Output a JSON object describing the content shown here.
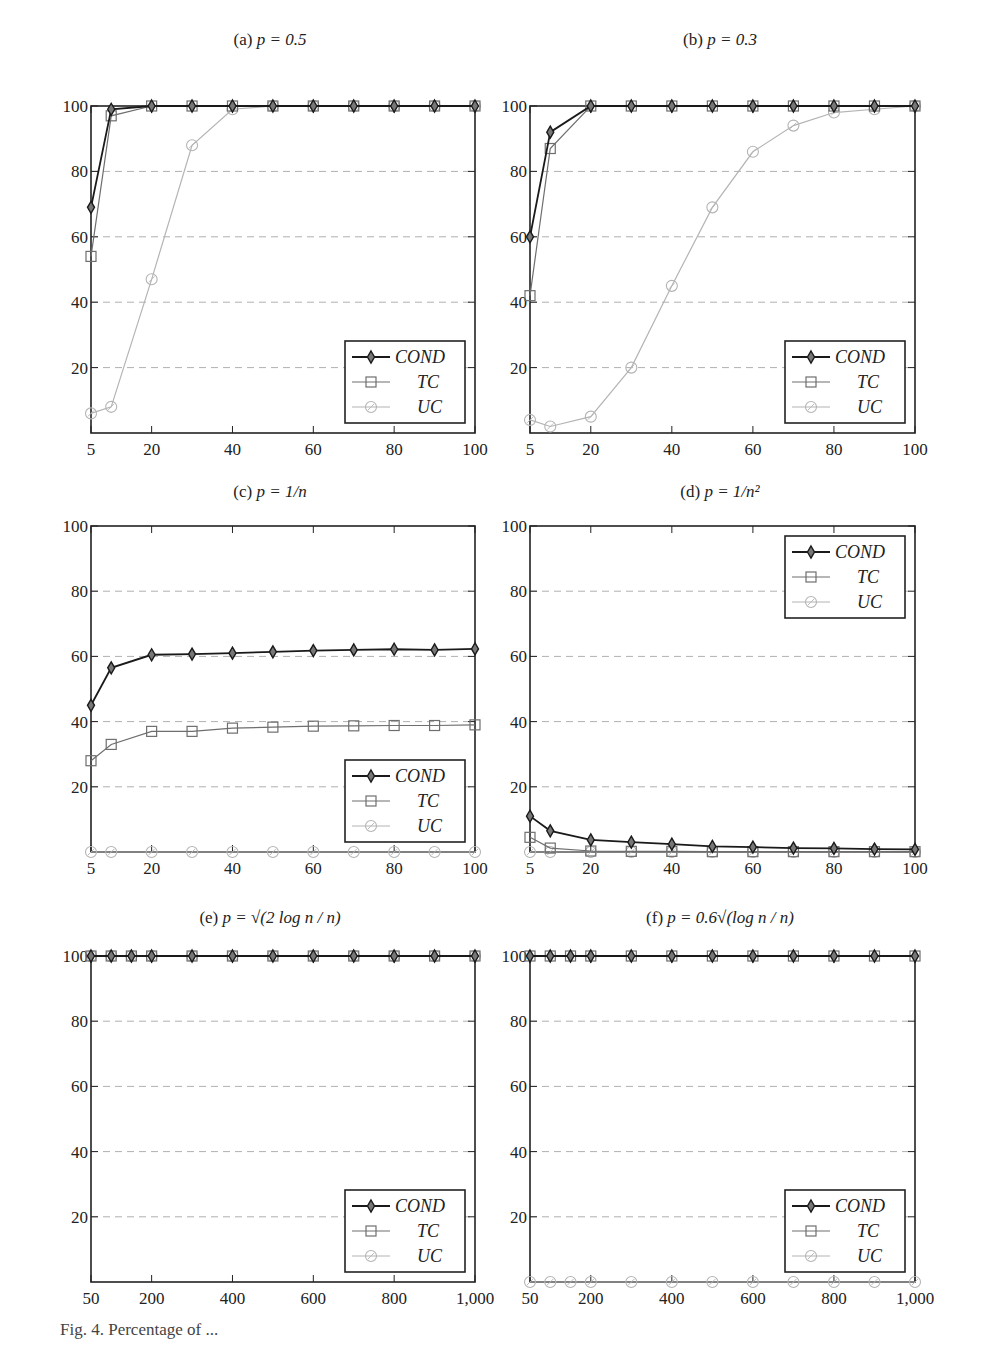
{
  "figure": {
    "caption_partial": "Fig. 4. Percentage of ..."
  },
  "legend": {
    "entries": [
      "COND",
      "TC",
      "UC"
    ]
  },
  "colors": {
    "COND": "#1a1a1a",
    "TC": "#6e6e6e",
    "UC": "#b4b4b4",
    "grid": "#b0b0b0",
    "axis": "#222222"
  },
  "chart_data": [
    {
      "id": "a",
      "type": "line",
      "title": "(a) p = 0.5",
      "title_label": "(a)",
      "title_expr": "p = 0.5",
      "xlabel": "",
      "ylabel": "",
      "xlim": [
        5,
        100
      ],
      "ylim": [
        0,
        100
      ],
      "xticks": [
        5,
        20,
        40,
        60,
        80,
        100
      ],
      "xtick_labels": [
        "5",
        "20",
        "40",
        "60",
        "80",
        "100"
      ],
      "yticks": [
        20,
        40,
        60,
        80,
        100
      ],
      "ytick_labels": [
        "20",
        "40",
        "60",
        "80",
        "100"
      ],
      "grid": "y-dashed",
      "legend_position": "lower right",
      "x": [
        5,
        10,
        20,
        30,
        40,
        50,
        60,
        70,
        80,
        90,
        100
      ],
      "series": [
        {
          "name": "COND",
          "values": [
            69,
            99,
            100,
            100,
            100,
            100,
            100,
            100,
            100,
            100,
            100
          ]
        },
        {
          "name": "TC",
          "values": [
            54,
            97,
            100,
            100,
            100,
            100,
            100,
            100,
            100,
            100,
            100
          ]
        },
        {
          "name": "UC",
          "values": [
            6,
            8,
            47,
            88,
            99,
            100,
            100,
            100,
            100,
            100,
            100
          ]
        }
      ]
    },
    {
      "id": "b",
      "type": "line",
      "title": "(b) p = 0.3",
      "title_label": "(b)",
      "title_expr": "p = 0.3",
      "xlabel": "",
      "ylabel": "",
      "xlim": [
        5,
        100
      ],
      "ylim": [
        0,
        100
      ],
      "xticks": [
        5,
        20,
        40,
        60,
        80,
        100
      ],
      "xtick_labels": [
        "5",
        "20",
        "40",
        "60",
        "80",
        "100"
      ],
      "yticks": [
        20,
        40,
        60,
        80,
        100
      ],
      "ytick_labels": [
        "20",
        "40",
        "60",
        "80",
        "100"
      ],
      "grid": "y-dashed",
      "legend_position": "lower right",
      "x": [
        5,
        10,
        20,
        30,
        40,
        50,
        60,
        70,
        80,
        90,
        100
      ],
      "series": [
        {
          "name": "COND",
          "values": [
            60,
            92,
            100,
            100,
            100,
            100,
            100,
            100,
            100,
            100,
            100
          ]
        },
        {
          "name": "TC",
          "values": [
            42,
            87,
            100,
            100,
            100,
            100,
            100,
            100,
            100,
            100,
            100
          ]
        },
        {
          "name": "UC",
          "values": [
            4,
            2,
            5,
            20,
            45,
            69,
            86,
            94,
            98,
            99,
            100
          ]
        }
      ]
    },
    {
      "id": "c",
      "type": "line",
      "title": "(c) p = 1/n",
      "title_label": "(c)",
      "title_expr": "p = 1/n",
      "xlabel": "",
      "ylabel": "",
      "xlim": [
        5,
        100
      ],
      "ylim": [
        0,
        100
      ],
      "xticks": [
        5,
        20,
        40,
        60,
        80,
        100
      ],
      "xtick_labels": [
        "5",
        "20",
        "40",
        "60",
        "80",
        "100"
      ],
      "yticks": [
        20,
        40,
        60,
        80,
        100
      ],
      "ytick_labels": [
        "20",
        "40",
        "60",
        "80",
        "100"
      ],
      "grid": "y-dashed",
      "legend_position": "lower right",
      "x": [
        5,
        10,
        20,
        30,
        40,
        50,
        60,
        70,
        80,
        90,
        100
      ],
      "series": [
        {
          "name": "COND",
          "values": [
            45,
            56.5,
            60.5,
            60.7,
            61,
            61.4,
            61.8,
            62,
            62.2,
            62,
            62.3
          ]
        },
        {
          "name": "TC",
          "values": [
            28,
            33,
            37,
            37,
            38,
            38.3,
            38.6,
            38.7,
            38.8,
            38.8,
            39
          ]
        },
        {
          "name": "UC",
          "values": [
            0,
            0,
            0,
            0,
            0,
            0,
            0,
            0,
            0,
            0,
            0
          ]
        }
      ]
    },
    {
      "id": "d",
      "type": "line",
      "title": "(d) p = 1/n^2",
      "title_label": "(d)",
      "title_expr": "p = 1/n²",
      "xlabel": "",
      "ylabel": "",
      "xlim": [
        5,
        100
      ],
      "ylim": [
        0,
        100
      ],
      "xticks": [
        5,
        20,
        40,
        60,
        80,
        100
      ],
      "xtick_labels": [
        "5",
        "20",
        "40",
        "60",
        "80",
        "100"
      ],
      "yticks": [
        20,
        40,
        60,
        80,
        100
      ],
      "ytick_labels": [
        "20",
        "40",
        "60",
        "80",
        "100"
      ],
      "grid": "y-dashed",
      "legend_position": "upper right",
      "x": [
        5,
        10,
        20,
        30,
        40,
        50,
        60,
        70,
        80,
        90,
        100
      ],
      "series": [
        {
          "name": "COND",
          "values": [
            11,
            6.5,
            3.7,
            3,
            2.4,
            1.7,
            1.5,
            1.2,
            1.1,
            0.9,
            0.8
          ]
        },
        {
          "name": "TC",
          "values": [
            4.5,
            1.2,
            0.3,
            0.2,
            0.2,
            0.1,
            0.1,
            0.1,
            0.1,
            0.1,
            0.1
          ]
        },
        {
          "name": "UC",
          "values": [
            0,
            0,
            0,
            0,
            0,
            0,
            0,
            0,
            0,
            0,
            0
          ]
        }
      ]
    },
    {
      "id": "e",
      "type": "line",
      "title": "(e) p = sqrt(2 log n / n)",
      "title_label": "(e)",
      "title_expr": "p = √(2 log n / n)",
      "xlabel": "",
      "ylabel": "",
      "xlim": [
        50,
        1000
      ],
      "ylim": [
        0,
        100
      ],
      "xticks": [
        50,
        200,
        400,
        600,
        800,
        1000
      ],
      "xtick_labels": [
        "50",
        "200",
        "400",
        "600",
        "800",
        "1,000"
      ],
      "yticks": [
        20,
        40,
        60,
        80,
        100
      ],
      "ytick_labels": [
        "20",
        "40",
        "60",
        "80",
        "100"
      ],
      "grid": "y-dashed",
      "legend_position": "lower right",
      "x": [
        50,
        100,
        150,
        200,
        300,
        400,
        500,
        600,
        700,
        800,
        900,
        1000
      ],
      "series": [
        {
          "name": "COND",
          "values": [
            100,
            100,
            100,
            100,
            100,
            100,
            100,
            100,
            100,
            100,
            100,
            100
          ]
        },
        {
          "name": "TC",
          "values": [
            100,
            100,
            100,
            100,
            100,
            100,
            100,
            100,
            100,
            100,
            100,
            100
          ]
        },
        {
          "name": "UC",
          "values": [
            100,
            100,
            100,
            100,
            100,
            100,
            100,
            100,
            100,
            100,
            100,
            100
          ]
        }
      ]
    },
    {
      "id": "f",
      "type": "line",
      "title": "(f) p = 0.6 sqrt(log n / n)",
      "title_label": "(f)",
      "title_expr": "p = 0.6√(log n / n)",
      "xlabel": "",
      "ylabel": "",
      "xlim": [
        50,
        1000
      ],
      "ylim": [
        0,
        100
      ],
      "xticks": [
        50,
        200,
        400,
        600,
        800,
        1000
      ],
      "xtick_labels": [
        "50",
        "200",
        "400",
        "600",
        "800",
        "1,000"
      ],
      "yticks": [
        20,
        40,
        60,
        80,
        100
      ],
      "ytick_labels": [
        "20",
        "40",
        "60",
        "80",
        "100"
      ],
      "grid": "y-dashed",
      "legend_position": "lower right",
      "x": [
        50,
        100,
        150,
        200,
        300,
        400,
        500,
        600,
        700,
        800,
        900,
        1000
      ],
      "series": [
        {
          "name": "COND",
          "values": [
            100,
            100,
            100,
            100,
            100,
            100,
            100,
            100,
            100,
            100,
            100,
            100
          ]
        },
        {
          "name": "TC",
          "values": [
            100,
            100,
            100,
            100,
            100,
            100,
            100,
            100,
            100,
            100,
            100,
            100
          ]
        },
        {
          "name": "UC",
          "values": [
            0,
            0,
            0,
            0,
            0,
            0,
            0,
            0,
            0,
            0,
            0,
            0
          ]
        }
      ]
    }
  ]
}
